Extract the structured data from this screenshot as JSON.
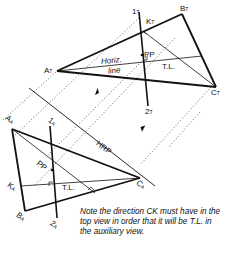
{
  "figure": {
    "type": "descriptive-geometry-auxiliary-view",
    "top_view": {
      "vertices": {
        "A": "AT",
        "B": "BT",
        "C": "CT"
      },
      "labels": {
        "a": "A",
        "a_sub": "T",
        "b": "B",
        "b_sub": "T",
        "c": "C",
        "c_sub": "T",
        "k": "K",
        "k_sub": "T",
        "one": "1",
        "one_sub": "T",
        "two": "2",
        "two_sub": "T",
        "pp": "PP",
        "horiz_line": "Horiz.",
        "horiz_line2": "line",
        "tl": "T.L."
      }
    },
    "auxiliary_view": {
      "labels": {
        "a": "A",
        "a_sub": "A",
        "b": "B",
        "b_sub": "A",
        "c": "C",
        "c_sub": "A",
        "k": "K",
        "k_sub": "A",
        "one": "1",
        "one_sub": "A",
        "two": "2",
        "two_sub": "A",
        "pp": "PP",
        "tl": "T.L."
      }
    },
    "reference_line": "HRP",
    "note": "Note the direction CK must have in the top view in order that it will be T.L. in the auxiliary view."
  },
  "colors": {
    "ink": "#111111",
    "projection": "#555555",
    "background": "#ffffff"
  }
}
